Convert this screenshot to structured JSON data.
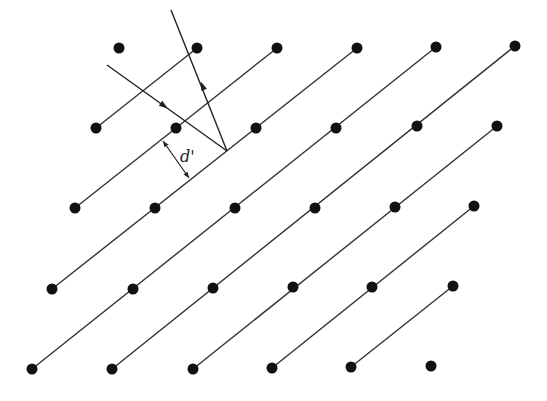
{
  "diagram": {
    "colors": {
      "point": "#111111",
      "line": "#333333",
      "ray": "#222222",
      "background": "#ffffff"
    },
    "point_radius": 5.5,
    "points": [
      [
        119,
        48
      ],
      [
        197,
        48
      ],
      [
        277,
        48
      ],
      [
        357,
        48
      ],
      [
        436,
        47
      ],
      [
        515,
        46
      ],
      [
        96,
        128
      ],
      [
        176,
        128
      ],
      [
        256,
        128
      ],
      [
        336,
        128
      ],
      [
        417,
        126
      ],
      [
        497,
        126
      ],
      [
        75,
        208
      ],
      [
        155,
        208
      ],
      [
        235,
        208
      ],
      [
        315,
        208
      ],
      [
        395,
        207
      ],
      [
        474,
        206
      ],
      [
        52,
        289
      ],
      [
        133,
        289
      ],
      [
        213,
        288
      ],
      [
        293,
        287
      ],
      [
        372,
        287
      ],
      [
        453,
        286
      ],
      [
        32,
        369
      ],
      [
        112,
        369
      ],
      [
        193,
        369
      ],
      [
        272,
        368
      ],
      [
        351,
        367
      ],
      [
        431,
        366
      ]
    ],
    "planes": [
      [
        [
          96,
          128
        ],
        [
          197,
          48
        ]
      ],
      [
        [
          75,
          208
        ],
        [
          277,
          48
        ]
      ],
      [
        [
          52,
          289
        ],
        [
          357,
          48
        ]
      ],
      [
        [
          32,
          369
        ],
        [
          436,
          47
        ]
      ],
      [
        [
          112,
          369
        ],
        [
          515,
          46
        ]
      ],
      [
        [
          193,
          369
        ],
        [
          497,
          126
        ]
      ],
      [
        [
          272,
          368
        ],
        [
          474,
          206
        ]
      ],
      [
        [
          351,
          367
        ],
        [
          453,
          286
        ]
      ]
    ],
    "incident_ray": {
      "from": [
        107,
        65
      ],
      "to": [
        227,
        151
      ],
      "arrow_at": [
        163,
        105
      ]
    },
    "reflected_ray": {
      "from": [
        227,
        151
      ],
      "to": [
        171,
        10
      ],
      "arrow_at": [
        203,
        87
      ]
    },
    "spacing_marker": {
      "from": [
        163,
        141
      ],
      "to": [
        189,
        178
      ],
      "label": "d'",
      "label_pos": [
        180,
        147
      ]
    }
  }
}
